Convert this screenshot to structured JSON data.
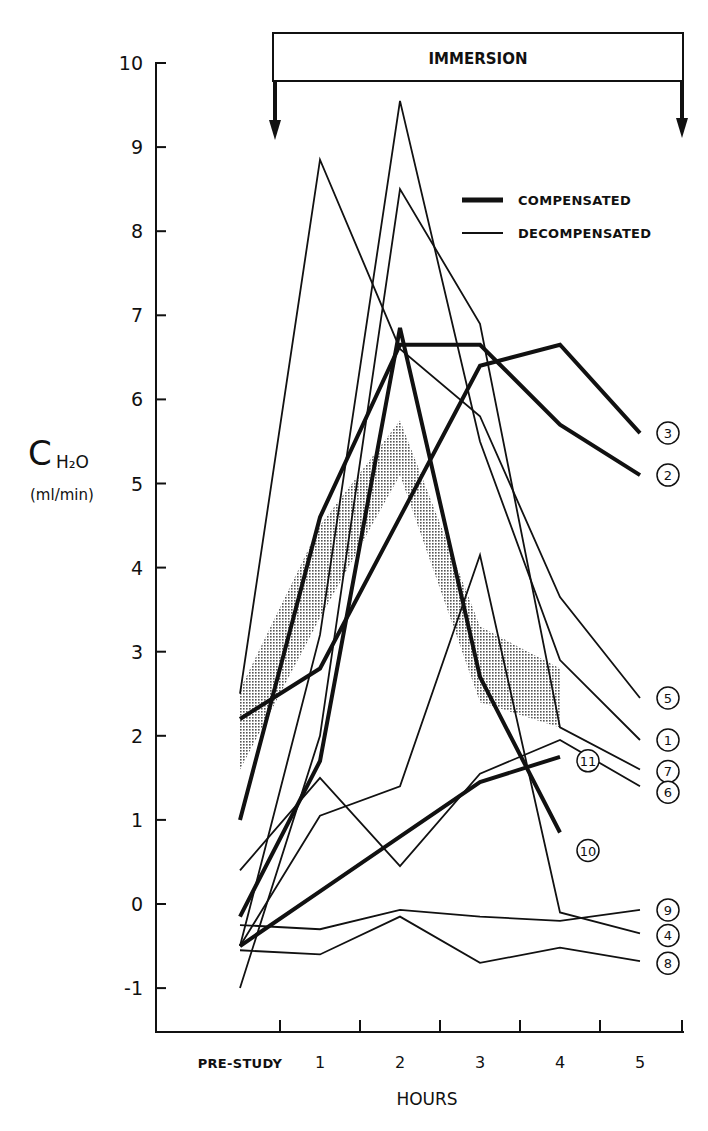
{
  "figure": {
    "banner": "IMMERSION",
    "y_axis_symbol": "C",
    "y_axis_subscript": "H₂O",
    "y_axis_unit": "(ml/min)",
    "x_axis_title": "HOURS",
    "legend": {
      "compensated": "COMPENSATED",
      "decompensated": "DECOMPENSATED"
    }
  },
  "chart_data": {
    "type": "line",
    "title": "",
    "xlabel": "HOURS",
    "ylabel": "C H2O (ml/min)",
    "categories": [
      "PRE-STUDY",
      "1",
      "2",
      "3",
      "4",
      "5"
    ],
    "ylim": [
      -1.5,
      10
    ],
    "yticks": [
      -1,
      0,
      1,
      2,
      3,
      4,
      5,
      6,
      7,
      8,
      9,
      10
    ],
    "grid": false,
    "legend_position": "upper right",
    "annotations": [
      "IMMERSION (bracket spanning from between PRE-STUDY and hour 1 to after hour 5, with downward arrows at both ends)"
    ],
    "shaded_band": {
      "description": "stippled range band",
      "lower": [
        1.6,
        3.4,
        5.1,
        2.4,
        2.1
      ],
      "upper": [
        2.55,
        4.5,
        5.75,
        3.3,
        2.8
      ]
    },
    "series": [
      {
        "name": "3",
        "group": "COMPENSATED",
        "values": [
          2.2,
          2.8,
          4.6,
          6.4,
          6.65,
          5.6
        ]
      },
      {
        "name": "2",
        "group": "COMPENSATED",
        "values": [
          1.0,
          4.6,
          6.65,
          6.65,
          5.7,
          5.1
        ]
      },
      {
        "name": "10",
        "group": "COMPENSATED",
        "values": [
          -0.15,
          1.7,
          6.85,
          2.7,
          0.85,
          null
        ]
      },
      {
        "name": "11",
        "group": "COMPENSATED",
        "values": [
          -0.5,
          0.15,
          0.8,
          1.45,
          1.75,
          null
        ]
      },
      {
        "name": "5",
        "group": "DECOMPENSATED",
        "values": [
          2.5,
          8.85,
          6.6,
          5.8,
          3.65,
          2.45
        ]
      },
      {
        "name": "1",
        "group": "DECOMPENSATED",
        "values": [
          -0.5,
          3.2,
          9.55,
          5.5,
          2.9,
          1.95
        ]
      },
      {
        "name": "7",
        "group": "DECOMPENSATED",
        "values": [
          -1.0,
          2.0,
          8.5,
          6.9,
          2.1,
          1.6
        ]
      },
      {
        "name": "6",
        "group": "DECOMPENSATED",
        "values": [
          0.4,
          1.5,
          0.45,
          1.55,
          1.95,
          1.4
        ]
      },
      {
        "name": "9",
        "group": "DECOMPENSATED",
        "values": [
          -0.25,
          -0.3,
          -0.07,
          -0.15,
          -0.2,
          -0.07
        ]
      },
      {
        "name": "4",
        "group": "DECOMPENSATED",
        "values": [
          -0.5,
          1.05,
          1.4,
          4.15,
          -0.1,
          -0.35
        ]
      },
      {
        "name": "8",
        "group": "DECOMPENSATED",
        "values": [
          -0.55,
          -0.6,
          -0.15,
          -0.7,
          -0.52,
          -0.68
        ]
      }
    ]
  }
}
